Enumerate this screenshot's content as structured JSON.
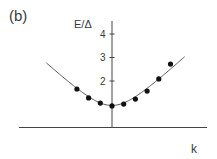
{
  "panel_label": "(b)",
  "chart_data": {
    "type": "scatter",
    "title": "",
    "xlabel": "k",
    "ylabel": "E/Δ",
    "ylim": [
      0,
      4.5
    ],
    "xlim": [
      -5.6,
      8.1
    ],
    "yticks": [
      2,
      3,
      4
    ],
    "ytick_labels": [
      "2",
      "3",
      "4"
    ],
    "grid": false,
    "legend": "none",
    "series": [
      {
        "name": "data points",
        "kind": "markers",
        "x": [
          -3,
          -2,
          -1,
          0,
          1,
          2,
          3,
          4,
          5
        ],
        "y": [
          1.66,
          1.28,
          1.06,
          0.94,
          1.02,
          1.23,
          1.57,
          2.09,
          2.72
        ]
      },
      {
        "name": "fit curve",
        "kind": "line",
        "formula": "E = sqrt(1 + c*k^2)",
        "min_value": 0.96,
        "x_range": [
          -5.6,
          6.2
        ]
      }
    ]
  }
}
